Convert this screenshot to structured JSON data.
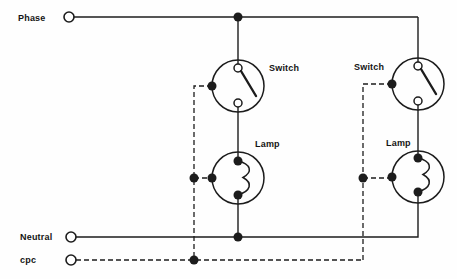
{
  "diagram": {
    "type": "lighting-circuit-wiring-diagram",
    "labels": {
      "phase": "Phase",
      "neutral": "Neutral",
      "cpc": "cpc",
      "switch_left": "Switch",
      "switch_right": "Switch",
      "lamp_left": "Lamp",
      "lamp_right": "Lamp"
    },
    "components": {
      "supply_terminals": [
        "Phase",
        "Neutral",
        "cpc"
      ],
      "switch_count": 2,
      "lamp_count": 2,
      "wire_styles": {
        "phase_and_neutral": "solid",
        "cpc": "dashed"
      }
    },
    "colors": {
      "line": "#1c1c1c",
      "text": "#141414",
      "background": "#fefefe"
    }
  }
}
